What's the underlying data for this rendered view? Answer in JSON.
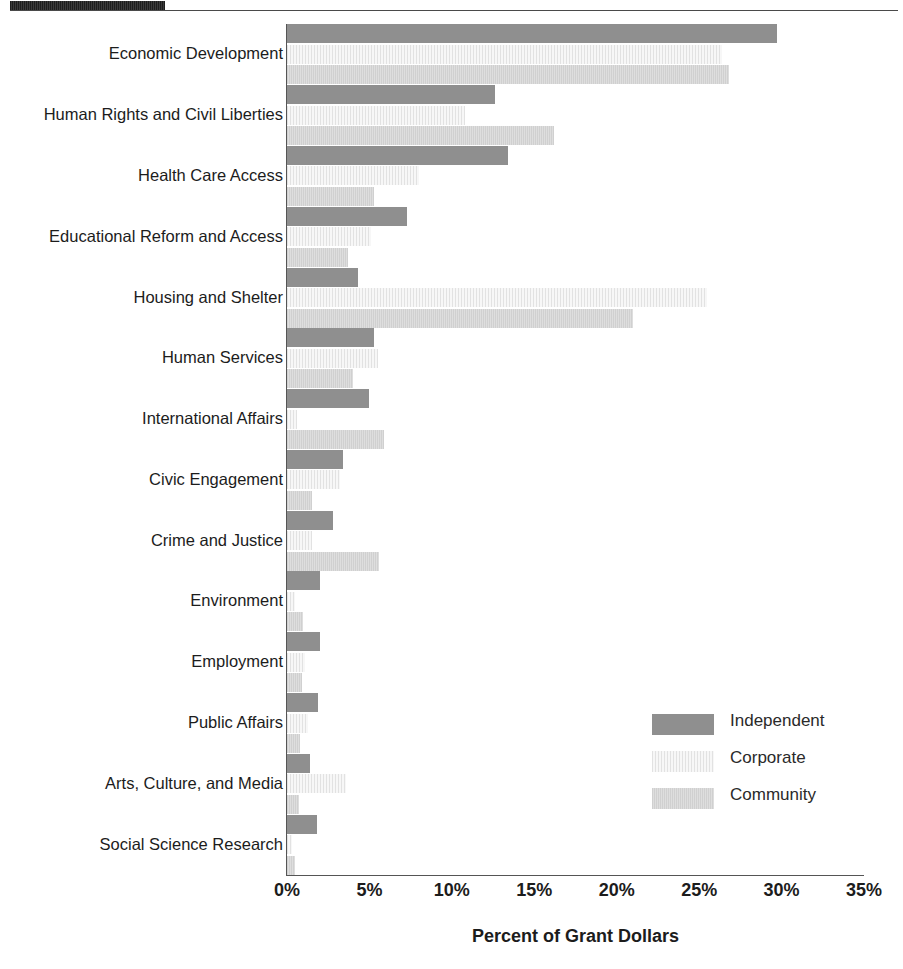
{
  "chart_data": {
    "type": "bar",
    "orientation": "horizontal",
    "title": "",
    "xlabel": "Percent of Grant Dollars",
    "ylabel": "",
    "xlim": [
      0,
      35
    ],
    "xticks": [
      "0%",
      "5%",
      "10%",
      "15%",
      "20%",
      "25%",
      "30%",
      "35%"
    ],
    "xtick_values": [
      0,
      5,
      10,
      15,
      20,
      25,
      30,
      35
    ],
    "grid": false,
    "legend_position": "center-right",
    "categories": [
      "Economic Development",
      "Human Rights and Civil Liberties",
      "Health Care Access",
      "Educational Reform and Access",
      "Housing and Shelter",
      "Human Services",
      "International Affairs",
      "Civic Engagement",
      "Crime and Justice",
      "Environment",
      "Employment",
      "Public Affairs",
      "Arts, Culture, and Media",
      "Social Science Research"
    ],
    "series": [
      {
        "name": "Independent",
        "color": "#8f8f8f",
        "values": [
          29.7,
          12.6,
          13.4,
          7.3,
          4.3,
          5.3,
          5.0,
          3.4,
          2.8,
          2.0,
          2.0,
          1.9,
          1.4,
          1.8
        ]
      },
      {
        "name": "Corporate",
        "color": "#ececec",
        "values": [
          26.4,
          10.8,
          8.0,
          5.1,
          25.5,
          5.5,
          0.6,
          3.2,
          1.5,
          0.5,
          1.1,
          1.3,
          3.6,
          0.3
        ]
      },
      {
        "name": "Community",
        "color": "#d7d7d7",
        "values": [
          26.8,
          16.2,
          5.3,
          3.7,
          21.0,
          4.0,
          5.9,
          1.5,
          5.6,
          1.0,
          0.9,
          0.8,
          0.7,
          0.5
        ]
      }
    ]
  },
  "legend": {
    "entries": [
      {
        "label": "Independent",
        "swatch": "independent"
      },
      {
        "label": "Corporate",
        "swatch": "corporate"
      },
      {
        "label": "Community",
        "swatch": "community"
      }
    ]
  },
  "axis": {
    "x_title": "Percent of Grant Dollars"
  }
}
